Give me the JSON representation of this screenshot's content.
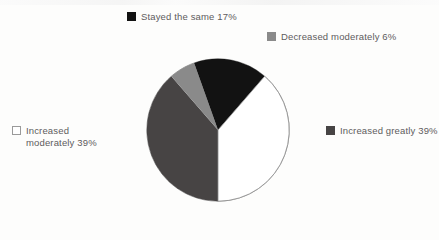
{
  "chart_data": {
    "type": "pie",
    "title": "",
    "subtitle": "",
    "xlabel": "",
    "ylabel": "",
    "legend_position": "around-pie",
    "grid": false,
    "categories": [
      "Increased greatly",
      "Decreased moderately",
      "Stayed the same",
      "Increased moderately"
    ],
    "values": [
      39,
      6,
      17,
      39
    ],
    "unit": "%",
    "slices": [
      {
        "label": "Increased greatly",
        "value": 39,
        "value_text": "39%",
        "legend_text": "Increased greatly 39%",
        "color": "#474444",
        "swatch_style": "filled",
        "start_angle_deg": 180,
        "end_angle_deg": 320.4
      },
      {
        "label": "Decreased moderately",
        "value": 6,
        "value_text": "6%",
        "legend_text": "Decreased moderately 6%",
        "color": "#8a8a8a",
        "swatch_style": "filled",
        "start_angle_deg": 320.4,
        "end_angle_deg": 342.0
      },
      {
        "label": "Stayed the same",
        "value": 17,
        "value_text": "17%",
        "legend_text": "Stayed the same 17%",
        "color": "#121212",
        "swatch_style": "filled",
        "start_angle_deg": 342.0,
        "end_angle_deg": 403.2
      },
      {
        "label": "Increased moderately",
        "value": 39,
        "value_text": "39%",
        "legend_text": "Increased moderately\nmoderately 39%",
        "color": "#ffffff",
        "swatch_style": "outlined",
        "start_angle_deg": 403.2,
        "end_angle_deg": 540
      }
    ]
  },
  "legend": {
    "stayed_the_same": {
      "text": "Stayed the same 17%",
      "swatch_color": "#121212"
    },
    "decreased_moderately": {
      "text": "Decreased moderately 6%",
      "swatch_color": "#8a8a8a"
    },
    "increased_greatly": {
      "text": "Increased greatly 39%",
      "swatch_color": "#474444"
    },
    "increased_moderately": {
      "text": "Increased\nmoderately 39%",
      "swatch_color": "#ffffff"
    }
  },
  "colors": {
    "background": "#fdfdfc",
    "text": "#5e5c5c",
    "pie_outline": "#8b8b8b",
    "black_slice": "#121212",
    "dark_gray_slice": "#474444",
    "light_gray_slice": "#8a8a8a",
    "white_slice": "#ffffff"
  }
}
